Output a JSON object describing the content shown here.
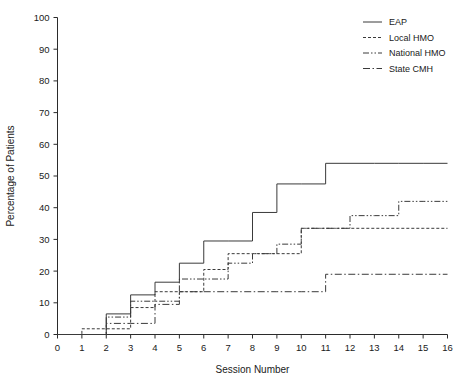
{
  "chart_data": {
    "type": "line",
    "subtype": "step-cumulative",
    "title": "",
    "xlabel": "Session Number",
    "ylabel": "Percentage of Patients",
    "xlim": [
      0,
      16
    ],
    "ylim": [
      0,
      100
    ],
    "xticks": [
      0,
      1,
      2,
      3,
      4,
      5,
      6,
      7,
      8,
      9,
      10,
      11,
      12,
      13,
      14,
      15,
      16
    ],
    "yticks": [
      0,
      10,
      20,
      30,
      40,
      50,
      60,
      70,
      80,
      90,
      100
    ],
    "grid": false,
    "legend_position": "top-right",
    "x": [
      0,
      1,
      2,
      3,
      4,
      5,
      6,
      7,
      8,
      9,
      10,
      11,
      12,
      13,
      14,
      15,
      16
    ],
    "series": [
      {
        "name": "EAP",
        "style": "solid",
        "color": "#3a3a3a",
        "values": [
          0,
          0,
          6.5,
          12.5,
          16.5,
          22.5,
          29.5,
          29.5,
          38.5,
          47.5,
          47.5,
          54,
          54,
          54,
          54,
          54,
          54
        ]
      },
      {
        "name": "Local HMO",
        "style": "dotted",
        "color": "#3a3a3a",
        "values": [
          0,
          1.8,
          1.8,
          8.5,
          13.5,
          13.5,
          20.5,
          25.5,
          25.5,
          25.5,
          33.5,
          33.5,
          33.5,
          33.5,
          33.5,
          33.5,
          33.5
        ]
      },
      {
        "name": "National HMO",
        "style": "dash-dot-dot",
        "color": "#3a3a3a",
        "values": [
          0,
          0,
          5.5,
          10.5,
          10.5,
          17.5,
          17.5,
          22.5,
          25.5,
          28.5,
          33.5,
          33.5,
          37.5,
          37.5,
          42,
          42,
          42
        ]
      },
      {
        "name": "State CMH",
        "style": "dash-dot",
        "color": "#3a3a3a",
        "values": [
          0,
          0,
          3.5,
          3.5,
          9.5,
          13.5,
          13.5,
          13.5,
          13.5,
          13.5,
          13.5,
          19,
          19,
          19,
          19,
          19,
          19
        ]
      }
    ],
    "legend": [
      "EAP",
      "Local HMO",
      "National HMO",
      "State CMH"
    ]
  }
}
